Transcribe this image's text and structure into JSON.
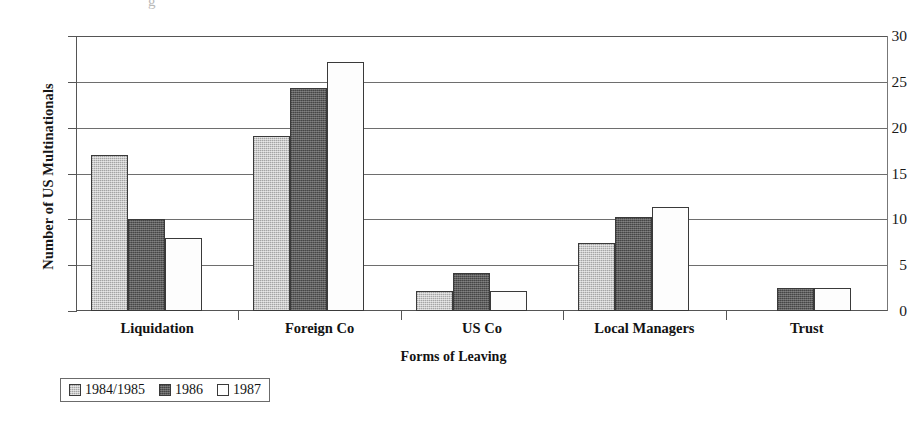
{
  "chart_data": {
    "type": "bar",
    "title": "",
    "xlabel": "Forms of Leaving",
    "ylabel": "Number of US Multinationals",
    "categories": [
      "Liquidation",
      "Foreign Co",
      "US Co",
      "Local Managers",
      "Trust"
    ],
    "series": [
      {
        "name": "1984/1985",
        "color": "#c9c9c9",
        "values": [
          17.0,
          19.1,
          2.2,
          7.4,
          0
        ]
      },
      {
        "name": "1986",
        "color": "#5c5c5c",
        "values": [
          10.0,
          24.3,
          4.2,
          10.3,
          2.5
        ]
      },
      {
        "name": "1987",
        "color": "#ffffff",
        "values": [
          8.0,
          27.2,
          2.2,
          11.3,
          2.5
        ]
      }
    ],
    "ylim": [
      0,
      30
    ],
    "yticks": [
      0,
      5,
      10,
      15,
      20,
      25,
      30
    ],
    "ytick_labels": [
      "0",
      "5",
      "10",
      "15",
      "20",
      "25",
      "30"
    ],
    "grid": "horizontal",
    "legend_position": "bottom-left",
    "legend_entries": [
      "1984/1985",
      "1986",
      "1987"
    ]
  },
  "title_remnant": "g"
}
